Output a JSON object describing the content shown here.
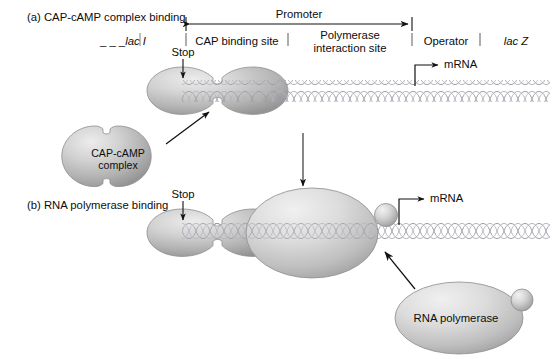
{
  "figure": {
    "panels": [
      {
        "id": "a",
        "label": "(a) CAP-cAMP complex binding"
      },
      {
        "id": "b",
        "label": "(b) RNA polymerase binding"
      }
    ],
    "map": {
      "span_label": "Promoter",
      "regions": [
        {
          "name": "lac I",
          "italic": true,
          "dashed_prefix": "_ _ _"
        },
        {
          "name": "CAP binding site",
          "italic": false
        },
        {
          "name": "Polymerase interaction site",
          "line1": "Polymerase",
          "line2": "interaction site",
          "italic": false
        },
        {
          "name": "Operator",
          "italic": false
        },
        {
          "name": "lac Z",
          "italic": true
        }
      ]
    },
    "annotations": {
      "stop_a": "Stop",
      "stop_b": "Stop",
      "mrna_a": "mRNA",
      "mrna_b": "mRNA"
    },
    "proteins": [
      {
        "id": "cap-bound-a",
        "label": "",
        "shape": "notched-oval"
      },
      {
        "id": "cap-free",
        "label_line1": "CAP-cAMP",
        "label_line2": "complex",
        "shape": "notched-circle"
      },
      {
        "id": "cap-bound-b",
        "label": "",
        "shape": "notched-oval"
      },
      {
        "id": "rnap-bound",
        "label": "",
        "shape": "ellipse-with-sigma"
      },
      {
        "id": "rnap-free",
        "label": "RNA polymerase",
        "shape": "ellipse-with-sigma"
      }
    ],
    "colors": {
      "ink": "#0d0d0d",
      "dna": "#8f8f98",
      "protein_light": "#e3e3e3",
      "protein_mid": "#b9b9b9",
      "protein_dark": "#8c8c8c",
      "outline": "#6f6f6f"
    }
  }
}
